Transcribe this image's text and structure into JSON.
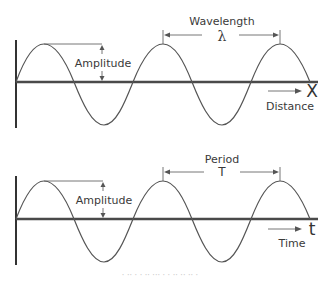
{
  "diagrams": [
    {
      "id": "wave-distance",
      "amplitude_label": "Amplitude",
      "span_label": "Wavelength",
      "span_symbol": "λ",
      "axis_letter": "X",
      "axis_label": "Distance"
    },
    {
      "id": "wave-time",
      "amplitude_label": "Amplitude",
      "span_label": "Period",
      "span_symbol": "T",
      "axis_letter": "t",
      "axis_label": "Time"
    }
  ],
  "caption": "· ·· ·  · ·· ··· ·  · ·· ·· ·· ·",
  "colors": {
    "line": "#555555",
    "axis": "#4a4a4a",
    "text": "#3a3a3a",
    "background": "#ffffff"
  }
}
